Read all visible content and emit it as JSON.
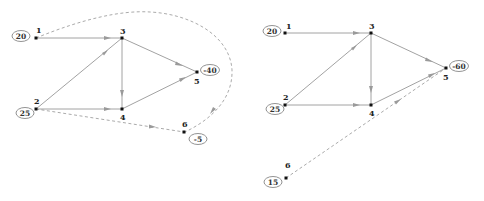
{
  "left_graph": {
    "nodes": [
      {
        "id": "1",
        "label": "1",
        "supply": "20"
      },
      {
        "id": "2",
        "label": "2",
        "supply": "25"
      },
      {
        "id": "3",
        "label": "3"
      },
      {
        "id": "4",
        "label": "4"
      },
      {
        "id": "5",
        "label": "5",
        "supply": "-40"
      },
      {
        "id": "6",
        "label": "6",
        "supply": "-5"
      }
    ],
    "edges": [
      {
        "from": "1",
        "to": "3",
        "style": "solid"
      },
      {
        "from": "2",
        "to": "3",
        "style": "solid"
      },
      {
        "from": "2",
        "to": "4",
        "style": "solid"
      },
      {
        "from": "3",
        "to": "4",
        "style": "solid"
      },
      {
        "from": "3",
        "to": "5",
        "style": "solid"
      },
      {
        "from": "4",
        "to": "5",
        "style": "solid"
      },
      {
        "from": "1",
        "to": "6",
        "style": "dashed"
      },
      {
        "from": "2",
        "to": "6",
        "style": "dashed"
      }
    ]
  },
  "right_graph": {
    "nodes": [
      {
        "id": "1",
        "label": "1",
        "supply": "20"
      },
      {
        "id": "2",
        "label": "2",
        "supply": "25"
      },
      {
        "id": "3",
        "label": "3"
      },
      {
        "id": "4",
        "label": "4"
      },
      {
        "id": "5",
        "label": "5",
        "supply": "-60"
      },
      {
        "id": "6",
        "label": "6",
        "supply": "15"
      }
    ],
    "edges": [
      {
        "from": "1",
        "to": "3",
        "style": "solid"
      },
      {
        "from": "2",
        "to": "3",
        "style": "solid"
      },
      {
        "from": "2",
        "to": "4",
        "style": "solid"
      },
      {
        "from": "3",
        "to": "4",
        "style": "solid"
      },
      {
        "from": "3",
        "to": "5",
        "style": "solid"
      },
      {
        "from": "4",
        "to": "5",
        "style": "solid"
      },
      {
        "from": "6",
        "to": "5",
        "style": "dashed"
      }
    ]
  }
}
